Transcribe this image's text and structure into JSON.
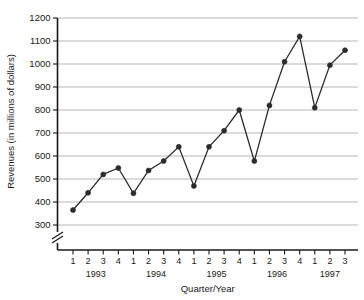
{
  "chart_data": {
    "type": "line",
    "title": "",
    "xlabel": "Quarter/Year",
    "ylabel": "Revenues (in millions of dollars)",
    "ylim": [
      300,
      1200
    ],
    "yticks": [
      300,
      400,
      500,
      600,
      700,
      800,
      900,
      1000,
      1100,
      1200
    ],
    "grid": true,
    "legend": "none",
    "axis_break": "y-axis below 300",
    "categories": [
      "1 1993",
      "2 1993",
      "3 1993",
      "4 1993",
      "1 1994",
      "2 1994",
      "3 1994",
      "4 1994",
      "1 1995",
      "2 1995",
      "3 1995",
      "4 1995",
      "1 1996",
      "2 1996",
      "3 1996",
      "4 1996",
      "1 1997",
      "2 1997",
      "3 1997"
    ],
    "quarter_labels": [
      "1",
      "2",
      "3",
      "4",
      "1",
      "2",
      "3",
      "4",
      "1",
      "2",
      "3",
      "4",
      "1",
      "2",
      "3",
      "4",
      "1",
      "2",
      "3"
    ],
    "year_labels": [
      "1993",
      "1994",
      "1995",
      "1996",
      "1997"
    ],
    "values": [
      365,
      440,
      520,
      548,
      438,
      537,
      578,
      640,
      470,
      640,
      710,
      800,
      578,
      820,
      1010,
      1120,
      810,
      995,
      1060
    ],
    "marker": "filled-circle",
    "line_color": "#2b2b2b",
    "grid_color": "#a6a6a6"
  }
}
